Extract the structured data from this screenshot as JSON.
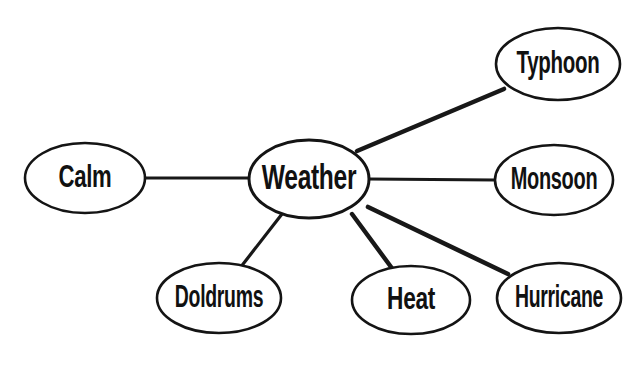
{
  "diagram": {
    "type": "concept-map",
    "background_color": "#ffffff",
    "stroke_color": "#141414",
    "text_color": "#111111",
    "central_node": {
      "id": "weather",
      "label": "Weather",
      "cx": 309,
      "cy": 179,
      "rx": 60,
      "ry": 39,
      "font_size": 30,
      "scale_x": 0.82
    },
    "nodes": [
      {
        "id": "calm",
        "label": "Calm",
        "cx": 85,
        "cy": 178,
        "rx": 60,
        "ry": 35,
        "font_size": 27,
        "scale_x": 0.82
      },
      {
        "id": "typhoon",
        "label": "Typhoon",
        "cx": 558,
        "cy": 64,
        "rx": 62,
        "ry": 36,
        "font_size": 27,
        "scale_x": 0.76
      },
      {
        "id": "monsoon",
        "label": "Monsoon",
        "cx": 554,
        "cy": 180,
        "rx": 59,
        "ry": 35,
        "font_size": 27,
        "scale_x": 0.74
      },
      {
        "id": "hurricane",
        "label": "Hurricane",
        "cx": 559,
        "cy": 298,
        "rx": 62,
        "ry": 35,
        "font_size": 27,
        "scale_x": 0.72
      },
      {
        "id": "heat",
        "label": "Heat",
        "cx": 411,
        "cy": 300,
        "rx": 59,
        "ry": 34,
        "font_size": 27,
        "scale_x": 0.84
      },
      {
        "id": "doldrums",
        "label": "Doldrums",
        "cx": 219,
        "cy": 298,
        "rx": 62,
        "ry": 35,
        "font_size": 27,
        "scale_x": 0.72
      }
    ],
    "edges": [
      {
        "id": "weather-calm",
        "from": "weather",
        "to": "calm",
        "x1": 250,
        "y1": 178,
        "x2": 145,
        "y2": 178,
        "width": 3.0
      },
      {
        "id": "weather-typhoon",
        "from": "weather",
        "to": "typhoon",
        "x1": 357,
        "y1": 151,
        "x2": 504,
        "y2": 89,
        "width": 4.6
      },
      {
        "id": "weather-monsoon",
        "from": "weather",
        "to": "monsoon",
        "x1": 369,
        "y1": 179,
        "x2": 495,
        "y2": 180,
        "width": 3.0
      },
      {
        "id": "weather-hurricane",
        "from": "weather",
        "to": "hurricane",
        "x1": 368,
        "y1": 207,
        "x2": 508,
        "y2": 274,
        "width": 4.6
      },
      {
        "id": "weather-heat",
        "from": "weather",
        "to": "heat",
        "x1": 352,
        "y1": 214,
        "x2": 394,
        "y2": 271,
        "width": 4.4
      },
      {
        "id": "weather-doldrums",
        "from": "weather",
        "to": "doldrums",
        "x1": 282,
        "y1": 214,
        "x2": 240,
        "y2": 268,
        "width": 3.2
      }
    ]
  }
}
